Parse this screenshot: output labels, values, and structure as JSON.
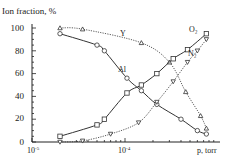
{
  "chart_data": {
    "type": "line",
    "title": "",
    "ylabel": "Ion fraction, %",
    "xlabel": "p, torr",
    "xscale": "log",
    "xlim": [
      1e-05,
      0.00085
    ],
    "ylim": [
      0,
      100
    ],
    "yticks": [
      0,
      20,
      40,
      60,
      80,
      100
    ],
    "xtick_labels": [
      "10⁻⁵",
      "10⁻⁴"
    ],
    "grid": false,
    "legend": "inline labels",
    "series": [
      {
        "name": "Y",
        "marker": "triangle",
        "line": "dotted",
        "x": [
          2e-05,
          3.5e-05,
          0.00015,
          0.0003,
          0.00045,
          0.00065,
          0.00075
        ],
        "y": [
          100,
          99,
          87,
          70,
          44,
          23,
          12
        ]
      },
      {
        "name": "Al",
        "marker": "circle",
        "line": "solid",
        "x": [
          2e-05,
          5e-05,
          6e-05,
          0.000105,
          0.00015,
          0.00022,
          0.0004,
          0.0006,
          0.00075
        ],
        "y": [
          95,
          85,
          80,
          56,
          45,
          33,
          20,
          10,
          7
        ]
      },
      {
        "name": "O₂",
        "marker": "square",
        "line": "solid",
        "x": [
          2e-05,
          5e-05,
          6e-05,
          0.000105,
          0.00015,
          0.00022,
          0.00033,
          0.00047,
          0.00075
        ],
        "y": [
          5,
          15,
          20,
          43,
          50,
          60,
          73,
          81,
          95
        ]
      },
      {
        "name": "N₂",
        "marker": "inverted-triangle",
        "line": "dotted",
        "x": [
          2e-05,
          3.5e-05,
          7e-05,
          0.00014,
          0.00022,
          0.00033,
          0.00047,
          0.0006,
          0.00075
        ],
        "y": [
          0,
          1,
          7,
          17,
          35,
          53,
          70,
          80,
          90
        ]
      }
    ]
  },
  "labels": {
    "ylabel": "Ion fraction, %",
    "xlabel": "p, torr",
    "y_series": "Y",
    "al_series": "Al",
    "o2_series": "O₂",
    "n2_series": "N₂",
    "x_tick_1": "10",
    "x_tick_1_exp": "-5",
    "x_tick_2": "10",
    "x_tick_2_exp": "-4",
    "y_ticks": [
      "0",
      "20",
      "40",
      "60",
      "80",
      "100"
    ]
  }
}
